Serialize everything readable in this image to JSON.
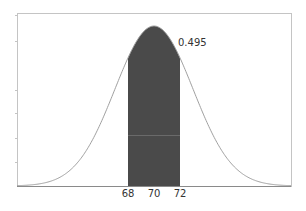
{
  "chart_data": {
    "type": "area",
    "title": "",
    "xlabel": "",
    "ylabel": "",
    "distribution": "normal",
    "mean": 70,
    "std_dev": 3,
    "shaded_interval": [
      68,
      72
    ],
    "shaded_area": 0.495,
    "x_ticks": [
      68,
      70,
      72
    ],
    "x_tick_labels": [
      "68",
      "70",
      "72"
    ],
    "xlim": [
      59.5,
      80.6
    ],
    "y_ticks_unlabeled": true,
    "grid": false,
    "legend": null,
    "annotation": "0.495",
    "colors": {
      "curve": "#9a9a9a",
      "fill": "#4a4a4a",
      "frame": "#b8b8b8",
      "axis": "#8a8a8a"
    }
  },
  "labels": {
    "area_value": "0.495",
    "tick_68": "68",
    "tick_70": "70",
    "tick_72": "72"
  }
}
